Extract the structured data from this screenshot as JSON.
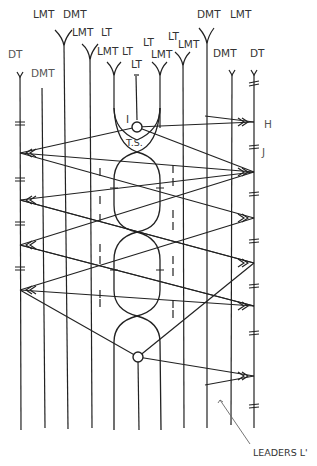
{
  "diagram": {
    "type": "bobbin-lace-pricking-diagram",
    "thread_labels_top": [
      {
        "text": "DT",
        "x": 8,
        "y": 58
      },
      {
        "text": "DMT",
        "x": 31,
        "y": 77
      },
      {
        "text": "LMT",
        "x": 33,
        "y": 18
      },
      {
        "text": "DMT",
        "x": 63,
        "y": 18
      },
      {
        "text": "LMT",
        "x": 72,
        "y": 36
      },
      {
        "text": "LT",
        "x": 101,
        "y": 36
      },
      {
        "text": "LMT",
        "x": 97,
        "y": 55
      },
      {
        "text": "LT",
        "x": 122,
        "y": 55
      },
      {
        "text": "LT",
        "x": 131,
        "y": 68
      },
      {
        "text": "LT",
        "x": 143,
        "y": 46
      },
      {
        "text": "LMT",
        "x": 151,
        "y": 58
      },
      {
        "text": "LT",
        "x": 168,
        "y": 40
      },
      {
        "text": "LMT",
        "x": 178,
        "y": 48
      },
      {
        "text": "DMT",
        "x": 197,
        "y": 18
      },
      {
        "text": "LMT",
        "x": 230,
        "y": 18
      },
      {
        "text": "DMT",
        "x": 213,
        "y": 57
      },
      {
        "text": "DT",
        "x": 250,
        "y": 57
      }
    ],
    "point_labels": [
      {
        "text": "I",
        "x": 126,
        "y": 123
      },
      {
        "text": "T.S.",
        "x": 131,
        "y": 145
      },
      {
        "text": "H",
        "x": 264,
        "y": 127
      },
      {
        "text": "J",
        "x": 262,
        "y": 157
      }
    ],
    "caption": {
      "text": "LEADERS L'",
      "x": 253,
      "y": 456
    },
    "colors": {
      "ink": "#222222",
      "label": "#333333",
      "background": "#ffffff"
    }
  }
}
